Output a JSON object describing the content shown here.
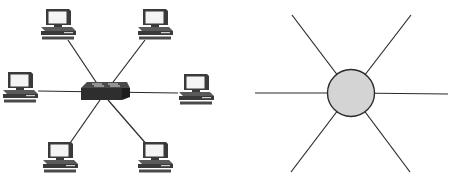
{
  "diagram": {
    "left": {
      "title": "Physical star topology with switch",
      "hub": {
        "type": "switch",
        "cx": 104,
        "cy": 94
      },
      "nodes": [
        {
          "id": "pc-top-left",
          "type": "computer",
          "x": 58,
          "y": 25
        },
        {
          "id": "pc-top-right",
          "type": "computer",
          "x": 155,
          "y": 25
        },
        {
          "id": "pc-left",
          "type": "computer",
          "x": 20,
          "y": 88
        },
        {
          "id": "pc-right",
          "type": "computer",
          "x": 193,
          "y": 88
        },
        {
          "id": "pc-bottom-left",
          "type": "computer",
          "x": 60,
          "y": 157
        },
        {
          "id": "pc-bottom-right",
          "type": "computer",
          "x": 155,
          "y": 157
        }
      ]
    },
    "right": {
      "title": "Abstract star topology",
      "hub": {
        "type": "circle",
        "cx": 351,
        "cy": 93,
        "r": 23,
        "fill": "#d4d4d4",
        "stroke": "#2a2a2a"
      },
      "spokes": [
        {
          "x": 292,
          "y": 15
        },
        {
          "x": 411,
          "y": 15
        },
        {
          "x": 255,
          "y": 93
        },
        {
          "x": 448,
          "y": 93
        },
        {
          "x": 291,
          "y": 172
        },
        {
          "x": 410,
          "y": 172
        }
      ]
    },
    "colors": {
      "line": "#2a2a2a",
      "device_dark": "#3a3a3a",
      "device_light": "#e8e8e8",
      "hub_fill": "#d4d4d4"
    }
  }
}
